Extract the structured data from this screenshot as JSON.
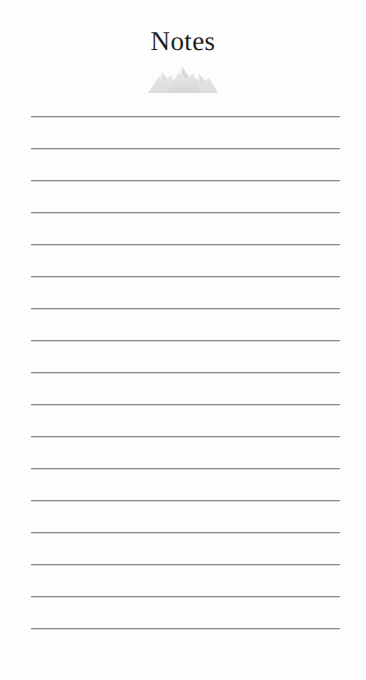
{
  "document": {
    "title": "Notes",
    "background_color": "#fdfdfd",
    "title_color": "#1d1d1d",
    "page_width": 366,
    "page_height": 680
  },
  "logo": {
    "icon_name": "mountain-range-icon",
    "color": "#e2e2e2",
    "shade_color": "#d3d3d3",
    "peaks": 3
  },
  "ruled_lines": {
    "count": 17,
    "color": "#8b8b8f",
    "left": 31,
    "right": 340,
    "width": 309,
    "first_top": 116,
    "spacing": 32,
    "tops": [
      116,
      148,
      180,
      212,
      244,
      276,
      308,
      340,
      372,
      404,
      436,
      468,
      500,
      532,
      564,
      596,
      628
    ],
    "values": [
      "",
      "",
      "",
      "",
      "",
      "",
      "",
      "",
      "",
      "",
      "",
      "",
      "",
      "",
      "",
      "",
      ""
    ]
  }
}
